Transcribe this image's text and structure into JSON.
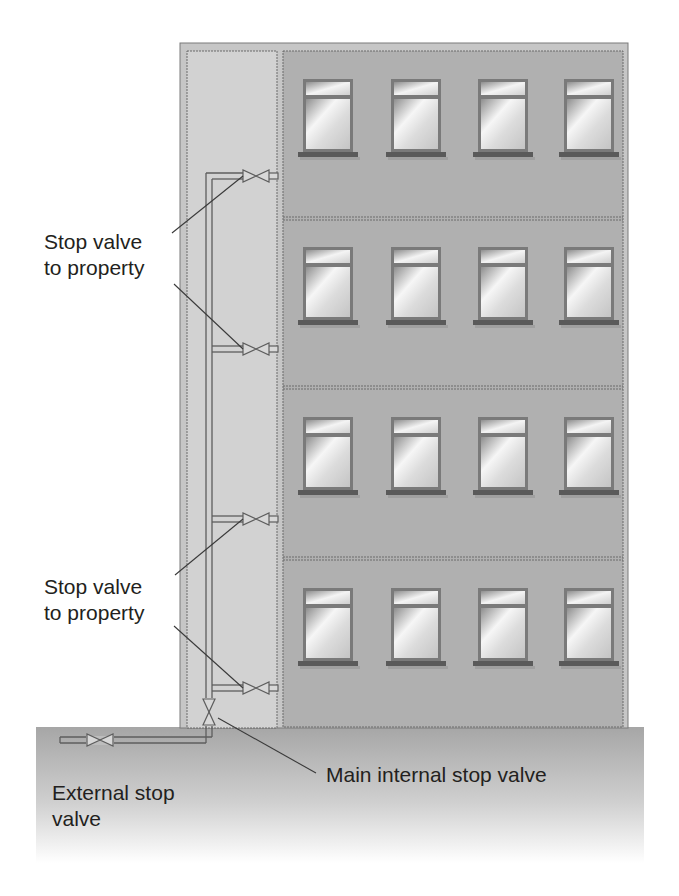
{
  "figure": {
    "type": "building-water-supply-diagram"
  },
  "labels": {
    "stop_valve_upper": {
      "line1": "Stop valve",
      "line2": "to property"
    },
    "stop_valve_lower": {
      "line1": "Stop valve",
      "line2": "to property"
    },
    "main_internal": "Main internal stop valve",
    "external": {
      "line1": "External stop",
      "line2": "valve"
    }
  },
  "building": {
    "floors": 4,
    "windows_per_floor": 4,
    "branch_valves": 4
  },
  "colors": {
    "building_fill": "#c9c9c9",
    "riser_column_fill": "#d4d4d4",
    "apartment_fill": "#b0b0b0",
    "outline": "#6b6b6b",
    "pipe": "#5e5e5e",
    "glass_light": "#f4f4f4",
    "glass_dark": "#9a9a9a",
    "ground_top": "#a9a9a9",
    "ground_bottom": "#ffffff",
    "text": "#231f20"
  }
}
